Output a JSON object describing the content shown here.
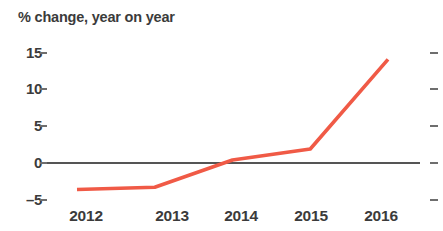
{
  "chart_data": {
    "type": "line",
    "title": "% change, year on year",
    "xlabel": "",
    "ylabel": "",
    "categories": [
      "2012",
      "2013",
      "2014",
      "2015",
      "2016"
    ],
    "x": [
      2012,
      2013,
      2014,
      2015,
      2016
    ],
    "values": [
      -3.7,
      -3.4,
      0.3,
      1.8,
      14.0
    ],
    "series": [
      {
        "name": "% change, year on year",
        "values": [
          -3.7,
          -3.4,
          0.3,
          1.8,
          14.0
        ],
        "color": "#F05A46"
      }
    ],
    "ylim": [
      -5,
      15
    ],
    "xlim": [
      2012,
      2016
    ],
    "y_ticks": [
      15,
      10,
      5,
      0,
      -5
    ],
    "y_tick_labels": [
      "15",
      "10",
      "5",
      "0",
      "–5"
    ],
    "x_ticks": [
      2012,
      2013,
      2014,
      2015,
      2016
    ],
    "x_tick_labels": [
      "2012",
      "2013",
      "2014",
      "2015",
      "2016"
    ],
    "grid": false,
    "legend": false,
    "legend_position": "none",
    "zero_line": true,
    "right_axis_ticks": true,
    "annotations": []
  },
  "colors": {
    "series_line": "#F05A46",
    "axis_text": "#3b3b3b",
    "tick_mark": "#6e6e6e",
    "zero_line": "#555555",
    "background": "#ffffff"
  },
  "axis": {
    "y_labels": [
      {
        "text": "15",
        "value": 15
      },
      {
        "text": "10",
        "value": 10
      },
      {
        "text": "5",
        "value": 5
      },
      {
        "text": "0",
        "value": 0
      },
      {
        "text": "–5",
        "value": -5
      }
    ],
    "x_labels": [
      {
        "text": "2012",
        "value": 2012
      },
      {
        "text": "2013",
        "value": 2013
      },
      {
        "text": "2014",
        "value": 2014
      },
      {
        "text": "2015",
        "value": 2015
      },
      {
        "text": "2016",
        "value": 2016
      }
    ]
  }
}
